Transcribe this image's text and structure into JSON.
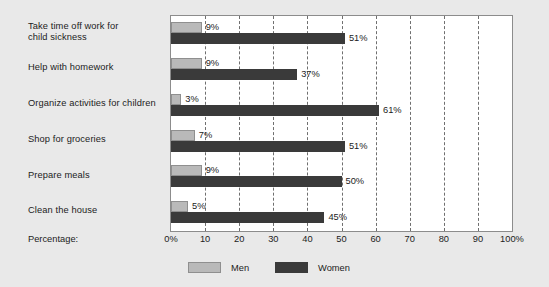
{
  "chart_data": {
    "type": "bar",
    "orientation": "horizontal",
    "title": "",
    "xlabel": "Percentage:",
    "ylabel": "",
    "xlim": [
      0,
      100
    ],
    "grid": true,
    "legend_position": "bottom",
    "categories": [
      "Take time off work for\nchild sickness",
      "Help with homework",
      "Organize activities for children",
      "Shop for groceries",
      "Prepare meals",
      "Clean the house"
    ],
    "series": [
      {
        "name": "Men",
        "color": "#b9b9b9",
        "values": [
          9,
          9,
          3,
          7,
          9,
          5
        ]
      },
      {
        "name": "Women",
        "color": "#3a3a3a",
        "values": [
          51,
          37,
          61,
          51,
          50,
          45
        ]
      }
    ],
    "value_labels": {
      "men": [
        "9%",
        "9%",
        "3%",
        "7%",
        "9%",
        "5%"
      ],
      "women": [
        "51%",
        "37%",
        "61%",
        "51%",
        "50%",
        "45%"
      ]
    },
    "xticks": [
      0,
      10,
      20,
      30,
      40,
      50,
      60,
      70,
      80,
      90,
      100
    ],
    "xtick_labels": [
      "0%",
      "10",
      "20",
      "30",
      "40",
      "50",
      "60",
      "70",
      "80",
      "90",
      "100%"
    ]
  },
  "axis_caption": "Percentage:",
  "legend": {
    "entries": [
      {
        "label": "Men"
      },
      {
        "label": "Women"
      }
    ]
  },
  "colors": {
    "background": "#e9e9e9",
    "plot_background": "#ffffff",
    "men": "#b9b9b9",
    "women": "#3a3a3a",
    "grid": "#6f6f6f",
    "axis": "#8c8c8c",
    "text": "#1c1c1c"
  }
}
